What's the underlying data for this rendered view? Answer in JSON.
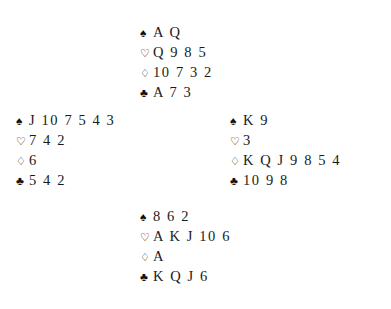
{
  "diagram": {
    "type": "bridge-deal-diagram",
    "background_color": "#ffffff",
    "ink_color": "#1a1a1a"
  },
  "suit_symbols": {
    "spades": "♠",
    "hearts": "♡",
    "diamonds": "♢",
    "clubs": "♣"
  },
  "suit_names": {
    "spades": "spade-suit-symbol",
    "hearts": "heart-suit-symbol",
    "diamonds": "diamond-suit-symbol",
    "clubs": "club-suit-symbol"
  },
  "hands": {
    "north": {
      "position": "North",
      "spades": "A Q",
      "hearts": "Q 9 8 5",
      "diamonds": "10 7 3 2",
      "clubs": "A 7 3"
    },
    "west": {
      "position": "West",
      "spades": "J 10 7 5 4 3",
      "hearts": "7 4 2",
      "diamonds": "6",
      "clubs": "5 4 2"
    },
    "east": {
      "position": "East",
      "spades": "K 9",
      "hearts": "3",
      "diamonds": "K Q J 9 8 5 4",
      "clubs": "10 9 8"
    },
    "south": {
      "position": "South",
      "spades": "8 6 2",
      "hearts": "A K J 10 6",
      "diamonds": "A",
      "clubs": "K Q J 6"
    }
  }
}
